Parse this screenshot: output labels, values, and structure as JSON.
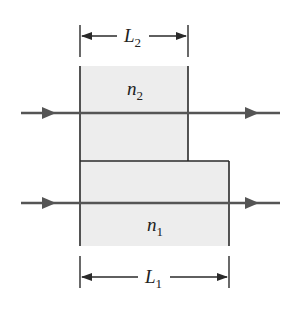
{
  "diagram": {
    "labels": {
      "top_dimension": "L",
      "top_dimension_sub": "2",
      "upper_medium": "n",
      "upper_medium_sub": "2",
      "lower_medium": "n",
      "lower_medium_sub": "1",
      "bottom_dimension": "L",
      "bottom_dimension_sub": "1"
    },
    "colors": {
      "line": "#2a2a2a",
      "ray": "#555555",
      "fill": "#ededed",
      "background": "#ffffff"
    }
  }
}
